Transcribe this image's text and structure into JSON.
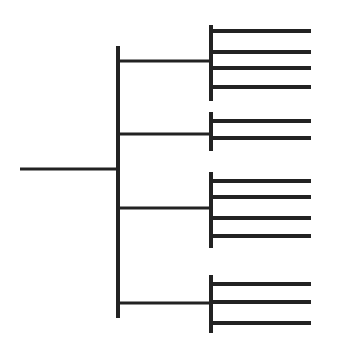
{
  "diagram": {
    "type": "tree",
    "orientation": "left-to-right",
    "line_color": "#222222",
    "background": "#ffffff",
    "stroke_widths": {
      "root": 3,
      "trunk": 4,
      "branch": 3,
      "group_trunk": 4,
      "leaf": 4
    },
    "root": {
      "x1": 20,
      "x2": 118,
      "y": 169
    },
    "trunk": {
      "x": 118,
      "y1": 46,
      "y2": 318
    },
    "branch_x2": 211,
    "leaf_x1": 211,
    "leaf_x2": 311,
    "groups": [
      {
        "branch_y": 61,
        "vy1": 25,
        "vy2": 101,
        "leaves": [
          31,
          52,
          68,
          87
        ]
      },
      {
        "branch_y": 134,
        "vy1": 112,
        "vy2": 151,
        "leaves": [
          121,
          138
        ]
      },
      {
        "branch_y": 208,
        "vy1": 172,
        "vy2": 248,
        "leaves": [
          181,
          197,
          218,
          236
        ]
      },
      {
        "branch_y": 303,
        "vy1": 275,
        "vy2": 333,
        "leaves": [
          284,
          302,
          323
        ]
      }
    ],
    "node_counts": {
      "level1_branches": 4,
      "leaves_total": 13,
      "leaves_per_group": [
        4,
        2,
        4,
        3
      ]
    }
  }
}
